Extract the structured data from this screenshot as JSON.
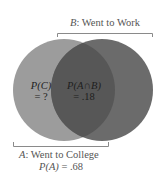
{
  "diagram": {
    "type": "venn",
    "set_b": {
      "letter": "B",
      "label": ": Went to Work"
    },
    "set_a": {
      "letter": "A",
      "label": ": Went to College"
    },
    "p_a": {
      "expr": "P(A)",
      "value": " = .68"
    },
    "region_c": {
      "expr": "P(C)",
      "value": "= ?"
    },
    "region_intersection": {
      "expr": "P(A∩B)",
      "value": "= .18"
    },
    "colors": {
      "circle_a": "#9c9c9c",
      "circle_b": "#6b6b6b",
      "intersection": "#575757",
      "bracket": "#8a8a8a",
      "text": "#555555"
    }
  }
}
